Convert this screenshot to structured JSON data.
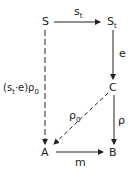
{
  "nodes": {
    "S": {
      "label": "S"
    },
    "St": {
      "label": "S",
      "sub": "t"
    },
    "C": {
      "label": "C"
    },
    "A": {
      "label": "A"
    },
    "B": {
      "label": "B"
    }
  },
  "edges": {
    "s_t": {
      "label": "s",
      "sub": "t",
      "from": "S",
      "to": "St",
      "style": "solid"
    },
    "e": {
      "label": "e",
      "from": "St",
      "to": "C",
      "style": "solid"
    },
    "rho": {
      "label": "ρ",
      "from": "C",
      "to": "B",
      "style": "solid"
    },
    "rho0": {
      "label": "ρ",
      "sub": "0",
      "from": "C",
      "to": "A",
      "style": "dashed"
    },
    "m": {
      "label": "m",
      "from": "A",
      "to": "B",
      "style": "solid"
    },
    "left": {
      "label_pre": "(s",
      "label_sub1": "t",
      "label_mid": "·e)ρ",
      "label_sub2": "0",
      "from": "S",
      "to": "A",
      "style": "dashed"
    }
  }
}
